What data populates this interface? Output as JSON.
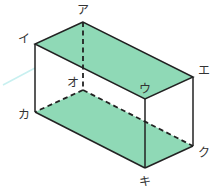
{
  "figure": {
    "type": "rectangular-prism",
    "colors": {
      "fill": "#8fd9b6",
      "edge": "#222222",
      "guide": "#c8f0f0"
    },
    "vertices": {
      "A": {
        "label": "ア"
      },
      "I": {
        "label": "イ"
      },
      "U": {
        "label": "ウ"
      },
      "E": {
        "label": "エ"
      },
      "O": {
        "label": "オ"
      },
      "KA": {
        "label": "カ"
      },
      "KI": {
        "label": "キ"
      },
      "KU": {
        "label": "ク"
      }
    },
    "shaded_faces": [
      "アイウエ",
      "オカキク"
    ]
  }
}
